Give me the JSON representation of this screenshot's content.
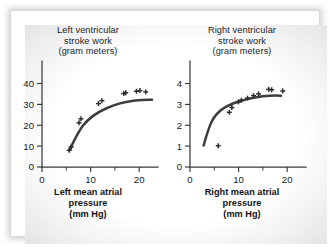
{
  "figure": {
    "background_color": "#ffffff",
    "ink_color": "#3a3a3a"
  },
  "chart_data": [
    {
      "type": "scatter",
      "panel": "left",
      "title": "Left ventricular stroke work (gram meters)",
      "title_lines": [
        "Left ventricular",
        "stroke work",
        "(gram meters)"
      ],
      "xlabel": "Left mean atrial pressure (mm Hg)",
      "xlabel_lines": [
        "Left mean atrial",
        "pressure",
        "(mm Hg)"
      ],
      "ylabel": "Left ventricular stroke work (gram meters)",
      "xlim": [
        0,
        23
      ],
      "ylim": [
        0,
        46
      ],
      "xticks": [
        0,
        10,
        20
      ],
      "xtick_labels": [
        "0",
        "10",
        "20"
      ],
      "xticks_minor": [
        5,
        15
      ],
      "yticks": [
        0,
        10,
        20,
        30,
        40
      ],
      "ytick_labels": [
        "0",
        "10",
        "20",
        "30",
        "40"
      ],
      "grid": false,
      "legend": false,
      "marker": "plus",
      "x": [
        5.6,
        6.0,
        7.6,
        8.0,
        11.6,
        12.3,
        16.8,
        17.2,
        19.4,
        20.1,
        21.3
      ],
      "y": [
        8.0,
        9.6,
        21.2,
        23.1,
        30.4,
        31.8,
        35.2,
        35.6,
        36.3,
        36.6,
        36.0
      ],
      "fit_note": "rising saturating curve from ~8 to plateau ~36.5"
    },
    {
      "type": "scatter",
      "panel": "right",
      "title": "Right ventricular stroke work (gram meters)",
      "title_lines": [
        "Right ventricular",
        "stroke work",
        "(gram meters)"
      ],
      "xlabel": "Right mean atrial pressure (mm Hg)",
      "xlabel_lines": [
        "Right mean atrial",
        "pressure",
        "(mm Hg)"
      ],
      "ylabel": "Right ventricular stroke work (gram meters)",
      "xlim": [
        0,
        23
      ],
      "ylim": [
        0,
        4.6
      ],
      "xticks": [
        0,
        10,
        20
      ],
      "xtick_labels": [
        "0",
        "10",
        "20"
      ],
      "xticks_minor": [
        5,
        15
      ],
      "yticks": [
        0,
        1,
        2,
        3,
        4
      ],
      "ytick_labels": [
        "0",
        "1",
        "2",
        "3",
        "4"
      ],
      "grid": false,
      "legend": false,
      "marker": "plus",
      "x": [
        5.6,
        7.8,
        8.3,
        9.6,
        10.2,
        11.4,
        12.6,
        13.6,
        15.6,
        16.2,
        18.4
      ],
      "y": [
        1.02,
        2.62,
        2.85,
        3.12,
        3.2,
        3.3,
        3.42,
        3.5,
        3.72,
        3.7,
        3.64
      ],
      "fit_note": "rising saturating curve from ~1.0 to plateau ~3.7"
    }
  ]
}
